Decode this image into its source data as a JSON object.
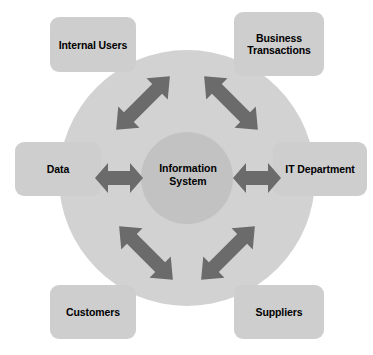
{
  "diagram": {
    "type": "hub-and-spoke",
    "center": {
      "label_line1": "Information",
      "label_line2": "System",
      "name": "information-system"
    },
    "nodes": [
      {
        "name": "internal-users",
        "label_line1": "Internal Users",
        "label_line2": "",
        "position": "top-left"
      },
      {
        "name": "business-transactions",
        "label_line1": "Business",
        "label_line2": "Transactions",
        "position": "top-right"
      },
      {
        "name": "data",
        "label_line1": "Data",
        "label_line2": "",
        "position": "left"
      },
      {
        "name": "it-department",
        "label_line1": "IT Department",
        "label_line2": "",
        "position": "right"
      },
      {
        "name": "customers",
        "label_line1": "Customers",
        "label_line2": "",
        "position": "bottom-left"
      },
      {
        "name": "suppliers",
        "label_line1": "Suppliers",
        "label_line2": "",
        "position": "bottom-right"
      }
    ],
    "connectors": [
      {
        "name": "arrow-internal-users",
        "style": "double-headed",
        "direction": "diagonal-nw-se"
      },
      {
        "name": "arrow-business-transactions",
        "style": "double-headed",
        "direction": "diagonal-ne-sw"
      },
      {
        "name": "arrow-data",
        "style": "double-headed",
        "direction": "horizontal"
      },
      {
        "name": "arrow-it-department",
        "style": "double-headed",
        "direction": "horizontal"
      },
      {
        "name": "arrow-customers",
        "style": "double-headed",
        "direction": "diagonal-sw-ne"
      },
      {
        "name": "arrow-suppliers",
        "style": "double-headed",
        "direction": "diagonal-se-nw"
      }
    ],
    "caption": "",
    "colors": {
      "background": "#ffffff",
      "outer_circle": "#d2d2d2",
      "center_circle": "#c2c2c2",
      "box_fill": "#cecece",
      "arrow_fill": "#6b6b6b",
      "text": "#000000"
    }
  }
}
